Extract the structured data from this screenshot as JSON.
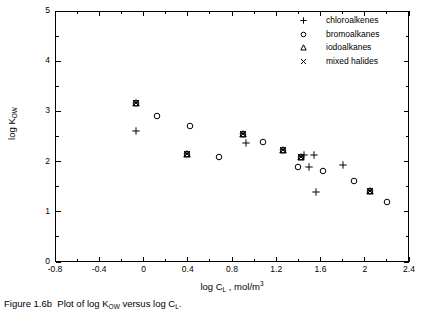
{
  "figure": {
    "caption_prefix": "Figure 1.6b",
    "caption_text": "Plot of log K",
    "caption_sub1": "OW",
    "caption_mid": " versus log C",
    "caption_sub2": "L",
    "caption_suffix": "."
  },
  "axes": {
    "x_title_main": "log C",
    "x_title_sub": "L",
    "x_title_unit": " , mol/m",
    "x_title_sup": "3",
    "y_title_main": "log K",
    "y_title_sub": "OW",
    "x_ticks": [
      "-0.8",
      "-0.4",
      "0",
      "0.4",
      "0.8",
      "1.2",
      "1.6",
      "2",
      "2.4"
    ],
    "y_ticks": [
      "0",
      "1",
      "2",
      "3",
      "4",
      "5"
    ],
    "x_min": -0.8,
    "x_max": 2.4,
    "y_min": 0,
    "y_max": 5
  },
  "legend": {
    "items": [
      {
        "label": "chloroalkenes",
        "marker": "plus-marker"
      },
      {
        "label": "bromoalkanes",
        "marker": "circle-marker"
      },
      {
        "label": "iodoalkanes",
        "marker": "triangle-marker"
      },
      {
        "label": "mixed halides",
        "marker": "cross-marker"
      }
    ]
  },
  "chart_data": {
    "type": "scatter",
    "xlabel": "log CL , mol/m3",
    "ylabel": "log KOW",
    "xlim": [
      -0.8,
      2.4
    ],
    "ylim": [
      0,
      5
    ],
    "xticks": [
      -0.8,
      -0.4,
      0,
      0.4,
      0.8,
      1.2,
      1.6,
      2,
      2.4
    ],
    "yticks": [
      0,
      1,
      2,
      3,
      4,
      5
    ],
    "grid": false,
    "legend_position": "top-right",
    "series": [
      {
        "name": "chloroalkenes",
        "marker": "plus",
        "points": [
          {
            "x": -0.07,
            "y": 2.6
          },
          {
            "x": 0.93,
            "y": 2.38
          },
          {
            "x": 1.45,
            "y": 2.14
          },
          {
            "x": 1.54,
            "y": 2.14
          },
          {
            "x": 1.5,
            "y": 1.89
          },
          {
            "x": 1.56,
            "y": 1.39
          },
          {
            "x": 1.8,
            "y": 1.94
          }
        ]
      },
      {
        "name": "bromoalkanes",
        "marker": "circle",
        "points": [
          {
            "x": -0.07,
            "y": 3.16
          },
          {
            "x": 0.12,
            "y": 2.9
          },
          {
            "x": 0.42,
            "y": 2.71
          },
          {
            "x": 0.39,
            "y": 2.16
          },
          {
            "x": 0.68,
            "y": 2.1
          },
          {
            "x": 0.9,
            "y": 2.54
          },
          {
            "x": 1.08,
            "y": 2.39
          },
          {
            "x": 1.26,
            "y": 2.23
          },
          {
            "x": 1.4,
            "y": 1.9
          },
          {
            "x": 1.42,
            "y": 2.1
          },
          {
            "x": 1.62,
            "y": 1.81
          },
          {
            "x": 1.9,
            "y": 1.61
          },
          {
            "x": 2.05,
            "y": 1.41
          },
          {
            "x": 2.2,
            "y": 1.19
          }
        ]
      },
      {
        "name": "iodoalkanes",
        "marker": "triangle",
        "points": [
          {
            "x": -0.07,
            "y": 3.16
          },
          {
            "x": 0.39,
            "y": 2.16
          },
          {
            "x": 0.9,
            "y": 2.54
          },
          {
            "x": 1.26,
            "y": 2.23
          },
          {
            "x": 1.42,
            "y": 2.1
          },
          {
            "x": 2.05,
            "y": 1.41
          }
        ]
      },
      {
        "name": "mixed halides",
        "marker": "cross",
        "points": [
          {
            "x": -0.07,
            "y": 3.16
          },
          {
            "x": 0.39,
            "y": 2.16
          },
          {
            "x": 0.9,
            "y": 2.54
          },
          {
            "x": 1.26,
            "y": 2.23
          },
          {
            "x": 1.42,
            "y": 2.1
          },
          {
            "x": 2.05,
            "y": 1.41
          }
        ]
      }
    ]
  }
}
